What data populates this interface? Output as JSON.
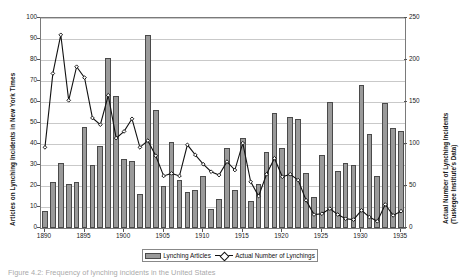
{
  "chart_data": {
    "type": "bar",
    "title": "",
    "subtitle": "",
    "xlabel": "",
    "ylabel": "Articles on Lynching Incidents in New York Times",
    "y2label": "Actual Number of Lynching Incidents (Tuskegee Institute's Data)",
    "grid": true,
    "legend_position": "bottom",
    "ylim": [
      0,
      100
    ],
    "y2lim": [
      0,
      250
    ],
    "ytick_labels": [
      "0",
      "10",
      "20",
      "30",
      "40",
      "50",
      "60",
      "70",
      "80",
      "90",
      "100"
    ],
    "ytick_values": [
      0,
      10,
      20,
      30,
      40,
      50,
      60,
      70,
      80,
      90,
      100
    ],
    "y2tick_labels": [
      "0",
      "50",
      "100",
      "150",
      "200",
      "250"
    ],
    "y2tick_values": [
      0,
      50,
      100,
      150,
      200,
      250
    ],
    "categories": [
      1890,
      1891,
      1892,
      1893,
      1894,
      1895,
      1896,
      1897,
      1898,
      1899,
      1900,
      1901,
      1902,
      1903,
      1904,
      1905,
      1906,
      1907,
      1908,
      1909,
      1910,
      1911,
      1912,
      1913,
      1914,
      1915,
      1916,
      1917,
      1918,
      1919,
      1920,
      1921,
      1922,
      1923,
      1924,
      1925,
      1926,
      1927,
      1928,
      1929,
      1930,
      1931,
      1932,
      1933,
      1934,
      1935
    ],
    "xtick_labels": [
      "1890",
      "1895",
      "1900",
      "1905",
      "1910",
      "1915",
      "1920",
      "1925",
      "1930",
      "1935"
    ],
    "xtick_values": [
      1890,
      1895,
      1900,
      1905,
      1910,
      1915,
      1920,
      1925,
      1930,
      1935
    ],
    "series": [
      {
        "name": "Lynching Articles",
        "type": "bar",
        "axis": "left",
        "color": "#9a9a9a",
        "edge_color": "#4a4a4a",
        "values": [
          8,
          22,
          31,
          21,
          22,
          48,
          30,
          39,
          81,
          63,
          33,
          32,
          16,
          92,
          56,
          20,
          41,
          23,
          17,
          18,
          25,
          9,
          14,
          38,
          18,
          43,
          13,
          21,
          36,
          55,
          38,
          53,
          130,
          26,
          15,
          35,
          60,
          27,
          31,
          30,
          68,
          45,
          25,
          149,
          119,
          115
        ]
      },
      {
        "name": "Actual Number of Lynchings",
        "type": "line",
        "axis": "right",
        "color": "#111111",
        "marker": "diamond",
        "values": [
          96,
          184,
          230,
          152,
          192,
          179,
          131,
          123,
          158,
          107,
          115,
          130,
          96,
          104,
          86,
          62,
          65,
          62,
          99,
          87,
          76,
          67,
          63,
          79,
          69,
          101,
          55,
          38,
          64,
          83,
          61,
          64,
          57,
          33,
          16,
          17,
          23,
          16,
          11,
          10,
          21,
          13,
          8,
          28,
          15,
          20
        ]
      }
    ],
    "line_points_left_scale": [
      38.4,
      73.6,
      92.0,
      60.8,
      76.8,
      71.6,
      52.4,
      49.2,
      63.2,
      42.8,
      46.0,
      52.0,
      38.4,
      41.6,
      34.4,
      24.8,
      26.0,
      24.8,
      39.6,
      34.8,
      30.4,
      26.8,
      25.2,
      31.6,
      27.6,
      40.4,
      22.0,
      15.2,
      25.6,
      33.2,
      24.4,
      25.6,
      22.8,
      13.2,
      6.4,
      6.8,
      9.2,
      6.4,
      4.4,
      4.0,
      8.4,
      5.2,
      3.2,
      11.2,
      6.0,
      8.0
    ]
  },
  "legend": {
    "items": [
      {
        "label": "Lynching Articles",
        "marker": "bar-swatch"
      },
      {
        "label": "Actual Number of Lynchings",
        "marker": "line-diamond"
      }
    ]
  },
  "axes": {
    "left_title": "Articles on Lynching Incidents in New York Times",
    "right_title_line1": "Actual Number of Lynching Incidents",
    "right_title_line2": "(Tuskegee Institute's Data)"
  },
  "caption": {
    "text": "Figure 4.2:  Frequency of lynching incidents in the United States"
  },
  "colors": {
    "bar_fill": "#9a9a9a",
    "bar_edge": "#4a4a4a",
    "line": "#111111",
    "grid": "#c9c9c9",
    "frame": "#7a7a7a"
  }
}
